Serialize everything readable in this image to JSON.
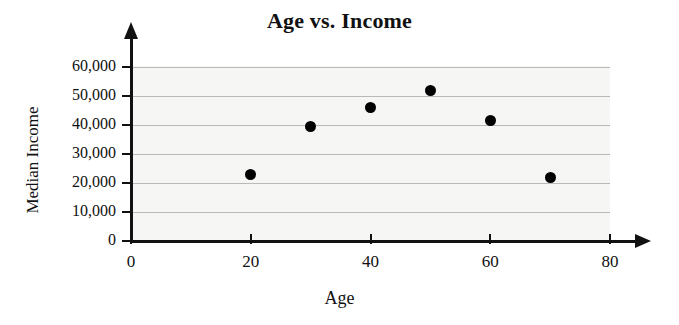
{
  "chart_data": {
    "type": "scatter",
    "title": "Age vs. Income",
    "xlabel": "Age",
    "ylabel": "Median Income",
    "xlim": [
      0,
      80
    ],
    "ylim": [
      0,
      65000
    ],
    "grid": true,
    "legend": "none",
    "xticks": [
      {
        "value": 0,
        "label": "0"
      },
      {
        "value": 20,
        "label": "20"
      },
      {
        "value": 40,
        "label": "40"
      },
      {
        "value": 60,
        "label": "60"
      },
      {
        "value": 80,
        "label": "80"
      }
    ],
    "yticks": [
      {
        "value": 0,
        "label": "0"
      },
      {
        "value": 10000,
        "label": "10,000"
      },
      {
        "value": 20000,
        "label": "20,000"
      },
      {
        "value": 30000,
        "label": "30,000"
      },
      {
        "value": 40000,
        "label": "40,000"
      },
      {
        "value": 50000,
        "label": "50,000"
      },
      {
        "value": 60000,
        "label": "60,000"
      }
    ],
    "x": [
      20,
      30,
      40,
      50,
      60,
      70
    ],
    "y": [
      23000,
      39500,
      46000,
      52000,
      41500,
      22000
    ],
    "points": [
      {
        "x": 20,
        "y": 23000
      },
      {
        "x": 30,
        "y": 39500
      },
      {
        "x": 40,
        "y": 46000
      },
      {
        "x": 50,
        "y": 52000
      },
      {
        "x": 60,
        "y": 41500
      },
      {
        "x": 70,
        "y": 22000
      }
    ],
    "marker": "filled-circle",
    "marker_color": "#000000",
    "plot_background": "#f6f6f4",
    "gridline_color": "#b9b9b9",
    "axis_color": "#111111"
  }
}
